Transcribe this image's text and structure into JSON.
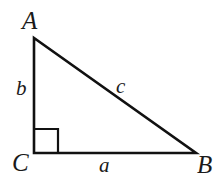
{
  "figure": {
    "type": "right-triangle-diagram",
    "background_color": "#ffffff",
    "stroke_color": "#111111",
    "vertices": [
      {
        "name": "A",
        "label": "A",
        "x": 34,
        "y": 38
      },
      {
        "name": "B",
        "label": "B",
        "x": 196,
        "y": 153
      },
      {
        "name": "C",
        "label": "C",
        "x": 34,
        "y": 153
      }
    ],
    "sides": [
      {
        "name": "a",
        "label": "a",
        "from": "C",
        "to": "B",
        "orientation": "horizontal"
      },
      {
        "name": "b",
        "label": "b",
        "from": "C",
        "to": "A",
        "orientation": "vertical"
      },
      {
        "name": "c",
        "label": "c",
        "from": "A",
        "to": "B",
        "orientation": "hypotenuse"
      }
    ],
    "right_angle": {
      "at_vertex": "C",
      "marker": "square",
      "size": 24
    }
  },
  "geometry": {
    "triangle_points": "34,38 34,153 196,153",
    "right_angle_points": "34,129 58,129 58,153",
    "stroke_width_triangle": 2.6,
    "stroke_width_marker": 2.2
  }
}
